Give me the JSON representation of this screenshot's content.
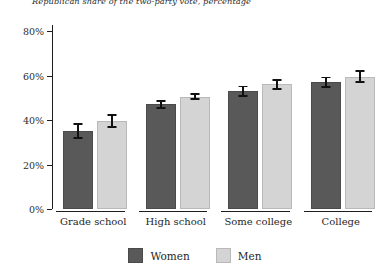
{
  "chart_data": {
    "type": "bar",
    "title": "Republican share of the two-party vote, percentage",
    "xlabel": "",
    "ylabel": "",
    "categories": [
      "Grade school",
      "High school",
      "Some college",
      "College"
    ],
    "series": [
      {
        "name": "Women",
        "color": "#595959",
        "values": [
          35,
          47,
          53,
          57
        ],
        "errors": [
          3.5,
          2.0,
          2.5,
          2.5
        ]
      },
      {
        "name": "Men",
        "color": "#d4d4d4",
        "values": [
          39.5,
          50.5,
          56,
          59.5
        ],
        "errors": [
          3.0,
          1.5,
          2.5,
          3.0
        ]
      }
    ],
    "ylim": [
      0,
      80
    ],
    "yticks": [
      0,
      20,
      40,
      60,
      80
    ],
    "ytick_labels": [
      "0%",
      "20%",
      "40%",
      "60%",
      "80%"
    ],
    "grid": false,
    "legend_position": "bottom",
    "error_bars": true
  }
}
